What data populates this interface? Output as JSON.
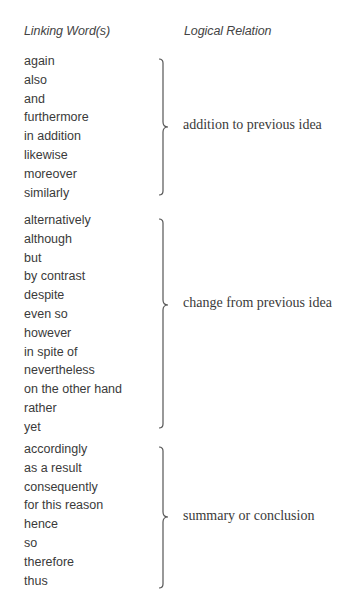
{
  "table": {
    "headers": {
      "linking_words": "Linking Word(s)",
      "logical_relation": "Logical Relation"
    },
    "groups": [
      {
        "relation": "addition to previous idea",
        "words": [
          "again",
          "also",
          "and",
          "furthermore",
          "in addition",
          "likewise",
          "moreover",
          "similarly"
        ]
      },
      {
        "relation": "change from previous idea",
        "words": [
          "alternatively",
          "although",
          "but",
          "by contrast",
          "despite",
          "even so",
          "however",
          "in spite of",
          "nevertheless",
          "on the other hand",
          "rather",
          "yet"
        ]
      },
      {
        "relation": "summary or conclusion",
        "words": [
          "accordingly",
          "as a result",
          "consequently",
          "for this reason",
          "hence",
          "so",
          "therefore",
          "thus"
        ]
      }
    ]
  },
  "colors": {
    "text": "#3a3a3a",
    "header_text": "#444444",
    "brace": "#555555",
    "background": "#ffffff"
  }
}
